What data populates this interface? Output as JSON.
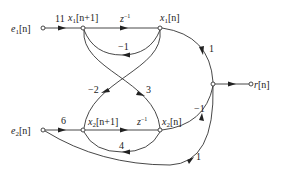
{
  "nodes": {
    "e1": {
      "label": "e1[n]",
      "base": "e",
      "sub": "1",
      "arg": "[n]"
    },
    "x1_next": {
      "label": "x1[n+1]",
      "base": "x",
      "sub": "1",
      "arg": "[n+1]"
    },
    "x1": {
      "label": "x1[n]",
      "base": "x",
      "sub": "1",
      "arg": "[n]"
    },
    "out": {
      "label": ""
    },
    "r": {
      "label": "r[n]",
      "base": "r",
      "arg": "[n]"
    },
    "e2": {
      "label": "e2[n]",
      "base": "e",
      "sub": "2",
      "arg": "[n]"
    },
    "x2_next": {
      "label": "x2[n+1]",
      "base": "x",
      "sub": "2",
      "arg": "[n+1]"
    },
    "x2": {
      "label": "x2[n]",
      "base": "x",
      "sub": "2",
      "arg": "[n]"
    }
  },
  "edges": [
    {
      "from": "e1",
      "to": "x1_next",
      "gain": "11"
    },
    {
      "from": "x1_next",
      "to": "x1",
      "gain": "z^-1",
      "gain_base": "z",
      "gain_exp": "−1"
    },
    {
      "from": "x1",
      "to": "x1_next",
      "gain": "−1"
    },
    {
      "from": "x1",
      "to": "x2_next",
      "gain": "−2"
    },
    {
      "from": "x1_next",
      "to": "x2",
      "gain": "3"
    },
    {
      "from": "x1",
      "to": "out",
      "gain": "1"
    },
    {
      "from": "out",
      "to": "r",
      "gain": ""
    },
    {
      "from": "e2",
      "to": "x2_next",
      "gain": "6"
    },
    {
      "from": "x2_next",
      "to": "x2",
      "gain": "z^-1",
      "gain_base": "z",
      "gain_exp": "−1"
    },
    {
      "from": "x2",
      "to": "x2_next",
      "gain": "4"
    },
    {
      "from": "x2",
      "to": "out",
      "gain": "−1"
    },
    {
      "from": "e2",
      "to": "out",
      "gain": "1"
    }
  ]
}
